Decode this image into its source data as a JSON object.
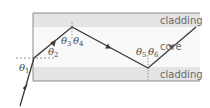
{
  "diagram": {
    "regions": {
      "top": "cladding",
      "middle": "core",
      "bottom": "cladding"
    },
    "angles": [
      {
        "symbol": "θ",
        "sub": "1"
      },
      {
        "symbol": "θ",
        "sub": "2"
      },
      {
        "symbol": "θ",
        "sub": "3"
      },
      {
        "symbol": "θ",
        "sub": "4"
      },
      {
        "symbol": "θ",
        "sub": "5"
      },
      {
        "symbol": "θ",
        "sub": "6"
      }
    ],
    "colors": {
      "cladding": "#e4e4e4",
      "core": "#f9f9f9",
      "border": "#8a8a8a",
      "ray": "#3a3a3a",
      "dashed": "#7a7a7a"
    }
  }
}
